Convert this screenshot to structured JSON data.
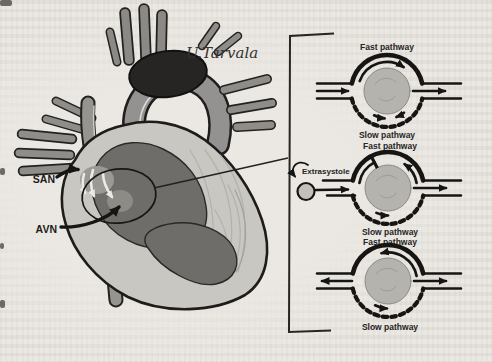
{
  "figure": {
    "signature": "U.Tarvala",
    "heart": {
      "san_label": "SAN",
      "avn_label": "AVN"
    },
    "panels": {
      "extrasystole_label": "Extrasystole",
      "diagram1": {
        "top_label": "Fast pathway",
        "bottom_label": "Slow pathway"
      },
      "diagram2": {
        "top_label": "Fast pathway",
        "bottom_label": "Slow pathway"
      },
      "diagram3": {
        "top_label": "Fast pathway",
        "bottom_label": "Slow pathway"
      }
    },
    "colors": {
      "ink": "#1d1c1a",
      "node_gray": "#b5b3ae",
      "vessel_gray": "#908e8a",
      "myocardium": "#c9c7c2",
      "chamber_dark": "#6f6d69",
      "page_background": "#ebe8e3"
    }
  }
}
